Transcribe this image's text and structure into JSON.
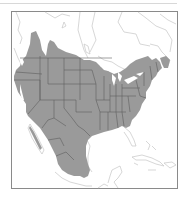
{
  "map": {
    "type": "species-range-map",
    "region": "North America",
    "legend": [],
    "colors": {
      "background": "#ffffff",
      "frame": "#8a8a8a",
      "land_outline": "#c4c4c4",
      "range_fill": "#9a9a9a",
      "range_borders": "#5e5e5e",
      "top_rule": "#d8d8d8"
    },
    "range_description": "Shaded range covers most of the contiguous United States, southern Canada east to the Maritimes, western Canada/BC interior, and most of Mexico; absent from Florida peninsula, Caribbean, and northern Canada."
  }
}
